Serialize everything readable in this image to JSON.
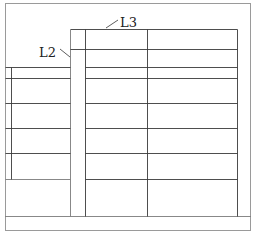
{
  "diagram": {
    "type": "structural grid layout drawing",
    "labels": [
      {
        "id": "L3",
        "text": "L3",
        "x": 120,
        "y": 25,
        "leader_from": [
          118,
          20
        ],
        "leader_to": [
          106,
          28
        ]
      },
      {
        "id": "L2",
        "text": "L2",
        "x": 39,
        "y": 56,
        "leader_from": [
          60,
          49
        ],
        "leader_to": [
          70,
          57
        ]
      }
    ],
    "colors": {
      "background": "#ffffff",
      "line": "#3a3a3a",
      "frame": "#9a9a9a"
    }
  }
}
